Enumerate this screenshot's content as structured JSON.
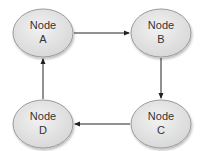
{
  "diagram": {
    "type": "directed-cycle",
    "nodes": [
      {
        "id": "A",
        "line1": "Node",
        "line2": "A",
        "cx": 43,
        "cy": 33
      },
      {
        "id": "B",
        "line1": "Node",
        "line2": "B",
        "cx": 161,
        "cy": 33
      },
      {
        "id": "C",
        "line1": "Node",
        "line2": "C",
        "cx": 161,
        "cy": 124
      },
      {
        "id": "D",
        "line1": "Node",
        "line2": "D",
        "cx": 43,
        "cy": 124
      }
    ],
    "edges": [
      {
        "from": "A",
        "to": "B"
      },
      {
        "from": "B",
        "to": "C"
      },
      {
        "from": "C",
        "to": "D"
      },
      {
        "from": "D",
        "to": "A"
      }
    ],
    "colors": {
      "node_fill": "#e8e8e8",
      "node_stroke": "#9a9a9a",
      "edge": "#222222",
      "text": "#333333"
    }
  }
}
